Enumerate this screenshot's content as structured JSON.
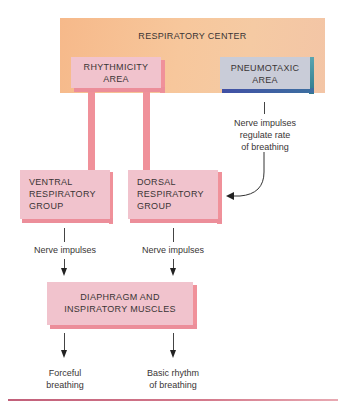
{
  "diagram": {
    "respiratory_center": {
      "label": "RESPIRATORY CENTER"
    },
    "rhythmicity_area": {
      "line1": "RHYTHMICITY",
      "line2": "AREA"
    },
    "pneumotaxic_area": {
      "line1": "PNEUMOTAXIC",
      "line2": "AREA"
    },
    "pneumotaxic_note": {
      "line1": "Nerve impulses",
      "line2": "regulate rate",
      "line3": "of breathing"
    },
    "ventral_group": {
      "line1": "VENTRAL",
      "line2": "RESPIRATORY",
      "line3": "GROUP"
    },
    "dorsal_group": {
      "line1": "DORSAL",
      "line2": "RESPIRATORY",
      "line3": "GROUP"
    },
    "ventral_note": "Nerve impulses",
    "dorsal_note": "Nerve impulses",
    "muscles": {
      "line1": "DIAPHRAGM AND",
      "line2": "INSPIRATORY MUSCLES"
    },
    "outcome_left": {
      "line1": "Forceful",
      "line2": "breathing"
    },
    "outcome_right": {
      "line1": "Basic rhythm",
      "line2": "of breathing"
    }
  },
  "colors": {
    "center_orange": "#f7c79c",
    "pink_box": "#f1c3cd",
    "pink_edge": "#f0919a",
    "pneumotaxic_box": "#c9ccd8",
    "pneumotaxic_edge_right": "#3b8a9a",
    "pneumotaxic_edge_bottom": "#4a5eaa",
    "rule": "#c2607a"
  }
}
